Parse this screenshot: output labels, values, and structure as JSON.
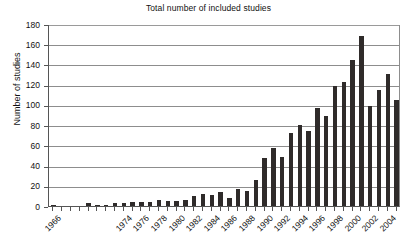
{
  "chart_data": {
    "type": "bar",
    "title": "Total number of included studies",
    "xlabel": "",
    "ylabel": "Number of studies",
    "ylim": [
      0,
      180
    ],
    "ytick_step": 20,
    "yticks": [
      0,
      20,
      40,
      60,
      80,
      100,
      120,
      140,
      160,
      180
    ],
    "grid": "horizontal",
    "legend": "none",
    "bar_color": "#2f2b2a",
    "xtick_label_rotation": -45,
    "categories": [
      "1966",
      "1967",
      "1968",
      "1969",
      "1970",
      "1971",
      "1972",
      "1973",
      "1974",
      "1975",
      "1976",
      "1977",
      "1978",
      "1979",
      "1980",
      "1981",
      "1982",
      "1983",
      "1984",
      "1985",
      "1986",
      "1987",
      "1988",
      "1989",
      "1990",
      "1991",
      "1992",
      "1993",
      "1994",
      "1995",
      "1996",
      "1997",
      "1998",
      "1999",
      "2000",
      "2001",
      "2002",
      "2003",
      "2004",
      "2005"
    ],
    "visible_tick_labels": [
      "1966",
      "1974",
      "1976",
      "1978",
      "1980",
      "1982",
      "1984",
      "1986",
      "1988",
      "1990",
      "1992",
      "1994",
      "1996",
      "1998",
      "2000",
      "2002",
      "2004"
    ],
    "values": [
      1,
      0,
      0,
      0,
      3,
      1,
      1,
      3,
      3,
      4,
      4,
      4,
      6,
      5,
      5,
      6,
      10,
      12,
      11,
      14,
      8,
      17,
      15,
      26,
      47,
      57,
      48,
      72,
      80,
      74,
      97,
      89,
      119,
      123,
      144,
      168,
      99,
      115,
      131,
      105
    ]
  }
}
